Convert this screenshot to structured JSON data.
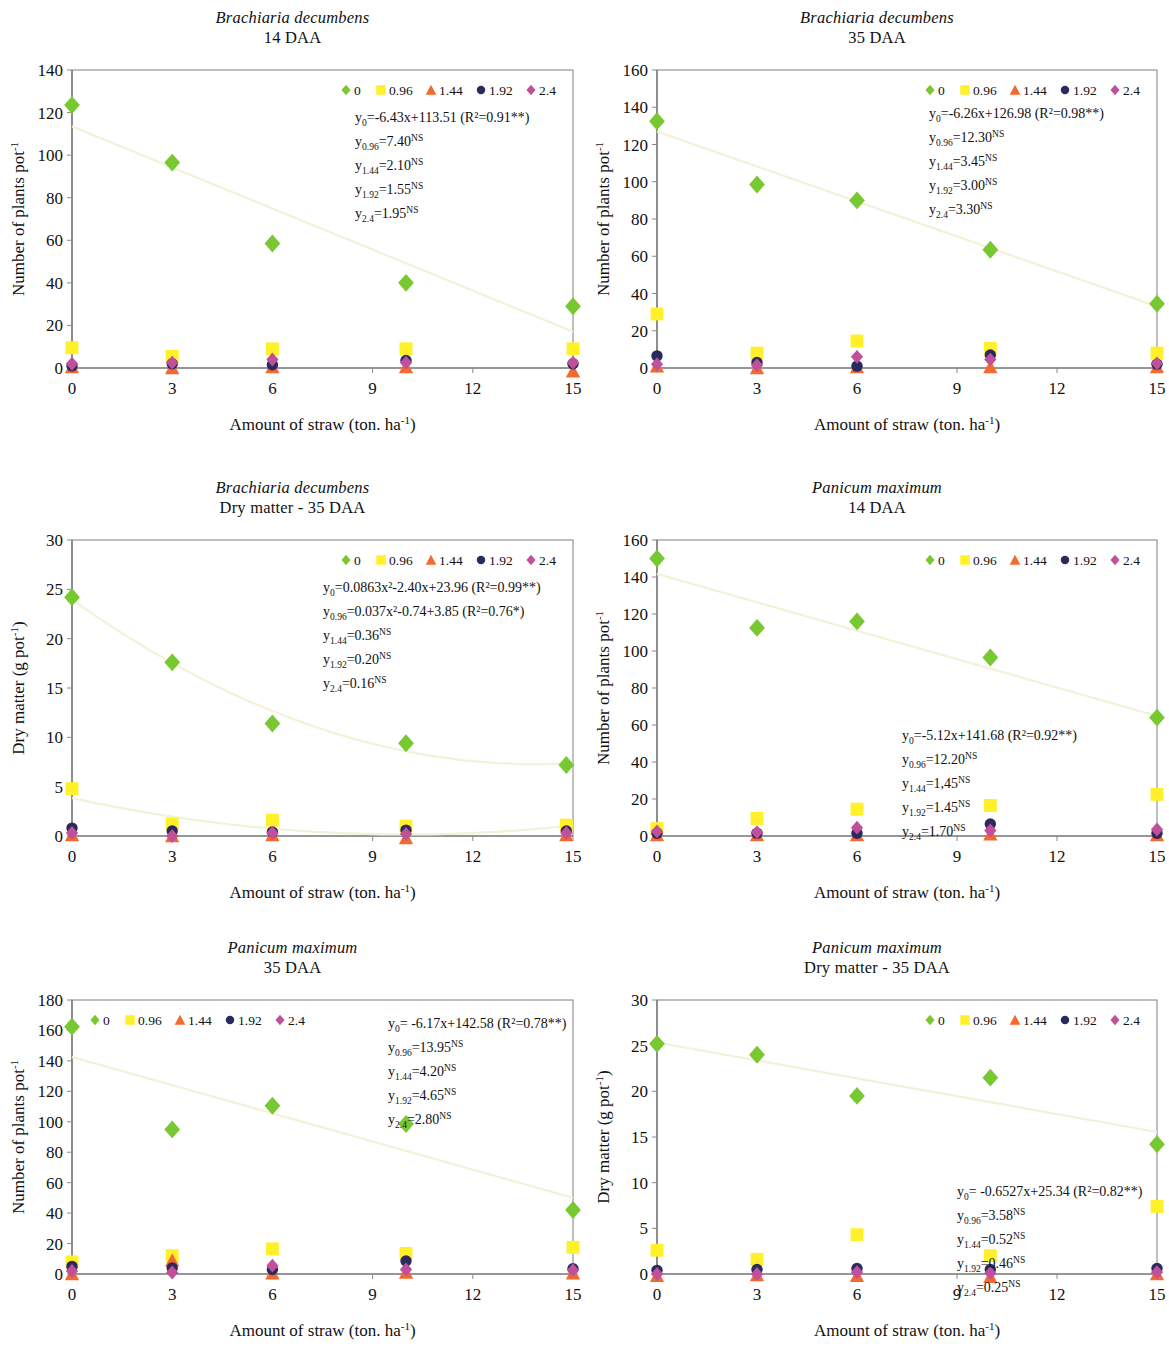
{
  "colors": {
    "s0": "#78c832",
    "s096": "#fff02a",
    "s144": "#f4692f",
    "s192": "#2b2a5e",
    "s24": "#c0509a",
    "trend": "#f1f1d4",
    "axis": "#6e6e6e",
    "frame": "#8a8a8a"
  },
  "legend": {
    "entries": [
      {
        "label": "0",
        "marker": "diamond",
        "color": "#78c832"
      },
      {
        "label": "0.96",
        "marker": "square",
        "color": "#fff02a"
      },
      {
        "label": "1.44",
        "marker": "triangle",
        "color": "#f4692f"
      },
      {
        "label": "1.92",
        "marker": "circle",
        "color": "#2b2a5e"
      },
      {
        "label": "2.4",
        "marker": "diamond",
        "color": "#c0509a"
      }
    ]
  },
  "common": {
    "xlabel_main": "Amount of straw (ton. ha",
    "xlabel_sup": "-1",
    "xlabel_tail": ")",
    "ylabel_count_main": "Number of plants pot",
    "ylabel_count_sup": "-1",
    "ylabel_dm_main": "Dry matter (g pot",
    "ylabel_dm_sup": "-1",
    "ylabel_dm_tail": ")",
    "xticks": [
      0,
      3,
      6,
      9,
      12,
      15
    ]
  },
  "chart_data": [
    {
      "id": "bd-14daa",
      "type": "scatter",
      "title_species": "Brachiaria decumbens",
      "title_sub": "14 DAA",
      "xlabel": "Amount of straw (ton. ha-1)",
      "ylabel": "Number of plants pot-1",
      "xlim": [
        0,
        15
      ],
      "ylim": [
        0,
        140
      ],
      "yticks": [
        0,
        20,
        40,
        60,
        80,
        100,
        120,
        140
      ],
      "xticks": [
        0,
        3,
        6,
        9,
        12,
        15
      ],
      "x": [
        0,
        3,
        6,
        10,
        15
      ],
      "series": [
        {
          "name": "0",
          "values": [
            123.5,
            96.5,
            58.5,
            40.0,
            29.0
          ]
        },
        {
          "name": "0.96",
          "values": [
            9.5,
            5.5,
            9.0,
            9.0,
            9.0
          ]
        },
        {
          "name": "1.44",
          "values": [
            0.5,
            0.0,
            0.5,
            0.5,
            -1.5
          ]
        },
        {
          "name": "1.92",
          "values": [
            1.0,
            2.0,
            1.5,
            3.5,
            2.0
          ]
        },
        {
          "name": "2.4",
          "values": [
            2.0,
            2.5,
            4.0,
            2.5,
            2.5
          ]
        }
      ],
      "trendline": {
        "type": "linear",
        "slope": -6.43,
        "intercept": 113.51
      },
      "equations": [
        {
          "ysub": "0",
          "text": "=-6.43x+113.51 (R²=0.91**)",
          "sup": ""
        },
        {
          "ysub": "0.96",
          "text": "=7.40",
          "sup": "NS"
        },
        {
          "ysub": "1.44",
          "text": "=2.10",
          "sup": "NS"
        },
        {
          "ysub": "1.92",
          "text": "=1.55",
          "sup": "NS"
        },
        {
          "ysub": "2.4",
          "text": "=1.95",
          "sup": "NS"
        }
      ]
    },
    {
      "id": "bd-35daa",
      "type": "scatter",
      "title_species": "Brachiaria decumbens",
      "title_sub": "35 DAA",
      "xlabel": "Amount of straw (ton. ha-1)",
      "ylabel": "Number of plants pot-1",
      "xlim": [
        0,
        15
      ],
      "ylim": [
        0,
        160
      ],
      "yticks": [
        0,
        20,
        40,
        60,
        80,
        100,
        120,
        140,
        160
      ],
      "xticks": [
        0,
        3,
        6,
        9,
        12,
        15
      ],
      "x": [
        0,
        3,
        6,
        10,
        15
      ],
      "series": [
        {
          "name": "0",
          "values": [
            132.5,
            98.5,
            90.0,
            63.5,
            34.5
          ]
        },
        {
          "name": "0.96",
          "values": [
            29.0,
            8.0,
            14.5,
            10.5,
            8.0
          ]
        },
        {
          "name": "1.44",
          "values": [
            1.0,
            0.0,
            0.5,
            0.5,
            0.5
          ]
        },
        {
          "name": "1.92",
          "values": [
            6.5,
            3.0,
            1.0,
            7.0,
            2.0
          ]
        },
        {
          "name": "2.4",
          "values": [
            2.0,
            1.5,
            6.0,
            4.5,
            2.5
          ]
        }
      ],
      "trendline": {
        "type": "linear",
        "slope": -6.26,
        "intercept": 126.98
      },
      "equations": [
        {
          "ysub": "0",
          "text": "=-6.26x+126.98 (R²=0.98**)",
          "sup": ""
        },
        {
          "ysub": "0.96",
          "text": "=12.30",
          "sup": "NS"
        },
        {
          "ysub": "1.44",
          "text": "=3.45",
          "sup": "NS"
        },
        {
          "ysub": "1.92",
          "text": "=3.00",
          "sup": "NS"
        },
        {
          "ysub": "2.4",
          "text": "=3.30",
          "sup": "NS"
        }
      ]
    },
    {
      "id": "bd-dm-35daa",
      "type": "scatter",
      "title_species": "Brachiaria decumbens",
      "title_sub": "Dry matter - 35 DAA",
      "xlabel": "Amount of straw (ton. ha-1)",
      "ylabel": "Dry matter (g pot-1)",
      "xlim": [
        0,
        15
      ],
      "ylim": [
        0,
        30
      ],
      "yticks": [
        0,
        5,
        10,
        15,
        20,
        25,
        30
      ],
      "xticks": [
        0,
        3,
        6,
        9,
        12,
        15
      ],
      "x": [
        0,
        3,
        6,
        10,
        14.8
      ],
      "series": [
        {
          "name": "0",
          "values": [
            24.2,
            17.6,
            11.4,
            9.4,
            7.2
          ]
        },
        {
          "name": "0.96",
          "values": [
            4.8,
            1.2,
            1.6,
            1.0,
            1.1
          ]
        },
        {
          "name": "1.44",
          "values": [
            0.1,
            0.0,
            0.1,
            -0.2,
            0.1
          ]
        },
        {
          "name": "1.92",
          "values": [
            0.8,
            0.5,
            0.4,
            0.6,
            0.5
          ]
        },
        {
          "name": "2.4",
          "values": [
            0.3,
            0.0,
            0.3,
            0.2,
            0.3
          ]
        }
      ],
      "trendline": {
        "type": "quadratic",
        "a": 0.0863,
        "b": -2.4,
        "c": 23.96
      },
      "equations": [
        {
          "ysub": "0",
          "text": "=0.0863x²-2.40x+23.96 (R²=0.99**)",
          "sup": ""
        },
        {
          "ysub": "0.96",
          "text": "=0.037x²-0.74+3.85 (R²=0.76*)",
          "sup": ""
        },
        {
          "ysub": "1.44",
          "text": "=0.36",
          "sup": "NS"
        },
        {
          "ysub": "1.92",
          "text": "=0.20",
          "sup": "NS"
        },
        {
          "ysub": "2.4",
          "text": "=0.16",
          "sup": "NS"
        }
      ]
    },
    {
      "id": "pm-14daa",
      "type": "scatter",
      "title_species": "Panicum maximum",
      "title_sub": "14 DAA",
      "xlabel": "Amount of straw (ton. ha-1)",
      "ylabel": "Number of plants pot-1",
      "xlim": [
        0,
        15
      ],
      "ylim": [
        0,
        160
      ],
      "yticks": [
        0,
        20,
        40,
        60,
        80,
        100,
        120,
        140,
        160
      ],
      "xticks": [
        0,
        3,
        6,
        9,
        12,
        15
      ],
      "x": [
        0,
        3,
        6,
        10,
        15
      ],
      "series": [
        {
          "name": "0",
          "values": [
            150.0,
            112.5,
            116.0,
            96.5,
            64.0
          ]
        },
        {
          "name": "0.96",
          "values": [
            4.0,
            9.5,
            14.5,
            16.5,
            22.5
          ]
        },
        {
          "name": "1.44",
          "values": [
            0.5,
            0.5,
            0.5,
            1.0,
            0.5
          ]
        },
        {
          "name": "1.92",
          "values": [
            1.5,
            1.5,
            1.5,
            6.5,
            1.5
          ]
        },
        {
          "name": "2.4",
          "values": [
            2.5,
            2.0,
            4.5,
            3.0,
            3.5
          ]
        }
      ],
      "trendline": {
        "type": "linear",
        "slope": -5.12,
        "intercept": 141.68
      },
      "equations": [
        {
          "ysub": "0",
          "text": "=-5.12x+141.68 (R²=0.92**)",
          "sup": ""
        },
        {
          "ysub": "0.96",
          "text": "=12.20",
          "sup": "NS"
        },
        {
          "ysub": "1.44",
          "text": "=1,45",
          "sup": "NS"
        },
        {
          "ysub": "1.92",
          "text": "=1.45",
          "sup": "NS"
        },
        {
          "ysub": "2.4",
          "text": "=1.70",
          "sup": "NS"
        }
      ]
    },
    {
      "id": "pm-35daa",
      "type": "scatter",
      "title_species": "Panicum maximum",
      "title_sub": "35 DAA",
      "xlabel": "Amount of straw (ton. ha-1)",
      "ylabel": "Number of plants pot-1",
      "xlim": [
        0,
        15
      ],
      "ylim": [
        0,
        180
      ],
      "yticks": [
        0,
        20,
        40,
        60,
        80,
        100,
        120,
        140,
        160,
        180
      ],
      "xticks": [
        0,
        3,
        6,
        9,
        12,
        15
      ],
      "x": [
        0,
        3,
        6,
        10,
        15
      ],
      "series": [
        {
          "name": "0",
          "values": [
            162.5,
            95.0,
            110.5,
            98.5,
            42.0
          ]
        },
        {
          "name": "0.96",
          "values": [
            8.0,
            12.0,
            16.5,
            13.5,
            17.5
          ]
        },
        {
          "name": "1.44",
          "values": [
            0.0,
            9.0,
            0.5,
            1.0,
            0.5
          ]
        },
        {
          "name": "1.92",
          "values": [
            5.0,
            4.0,
            3.0,
            8.5,
            3.5
          ]
        },
        {
          "name": "2.4",
          "values": [
            2.0,
            1.0,
            5.5,
            3.0,
            2.5
          ]
        }
      ],
      "trendline": {
        "type": "linear",
        "slope": -6.17,
        "intercept": 142.58
      },
      "equations": [
        {
          "ysub": "0",
          "text": "= -6.17x+142.58 (R²=0.78**)",
          "sup": ""
        },
        {
          "ysub": "0.96",
          "text": "=13.95",
          "sup": "NS"
        },
        {
          "ysub": "1.44",
          "text": "=4.20",
          "sup": "NS"
        },
        {
          "ysub": "1.92",
          "text": "=4.65",
          "sup": "NS"
        },
        {
          "ysub": "2.4",
          "text": "=2.80",
          "sup": "NS"
        }
      ]
    },
    {
      "id": "pm-dm-35daa",
      "type": "scatter",
      "title_species": "Panicum maximum",
      "title_sub": "Dry matter - 35 DAA",
      "xlabel": "Amount of straw (ton. ha-1)",
      "ylabel": "Dry matter (g pot-1)",
      "xlim": [
        0,
        15
      ],
      "ylim": [
        0,
        30
      ],
      "yticks": [
        0,
        5,
        10,
        15,
        20,
        25,
        30
      ],
      "xticks": [
        0,
        3,
        6,
        9,
        12,
        15
      ],
      "x": [
        0,
        3,
        6,
        10,
        15
      ],
      "series": [
        {
          "name": "0",
          "values": [
            25.2,
            24.0,
            19.5,
            21.5,
            14.2
          ]
        },
        {
          "name": "0.96",
          "values": [
            2.6,
            1.6,
            4.3,
            2.0,
            7.4
          ]
        },
        {
          "name": "1.44",
          "values": [
            -0.2,
            -0.1,
            -0.2,
            -0.3,
            0.0
          ]
        },
        {
          "name": "1.92",
          "values": [
            0.4,
            0.5,
            0.6,
            0.5,
            0.6
          ]
        },
        {
          "name": "2.4",
          "values": [
            0.0,
            0.0,
            0.2,
            0.1,
            0.2
          ]
        }
      ],
      "trendline": {
        "type": "linear",
        "slope": -0.6527,
        "intercept": 25.34
      },
      "equations": [
        {
          "ysub": "0",
          "text": "= -0.6527x+25.34 (R²=0.82**)",
          "sup": ""
        },
        {
          "ysub": "0.96",
          "text": "=3.58",
          "sup": "NS"
        },
        {
          "ysub": "1.44",
          "text": "=0.52",
          "sup": "NS"
        },
        {
          "ysub": "1.92",
          "text": "=0.46",
          "sup": "NS"
        },
        {
          "ysub": "2.4",
          "text": "=0.25",
          "sup": "NS"
        }
      ]
    }
  ],
  "layout": {
    "legend_pos": [
      "right",
      "right",
      "right",
      "right",
      "left",
      "right"
    ],
    "eq_pos": [
      "right",
      "right",
      "right",
      "mid-right",
      "right",
      "mid-right"
    ]
  }
}
